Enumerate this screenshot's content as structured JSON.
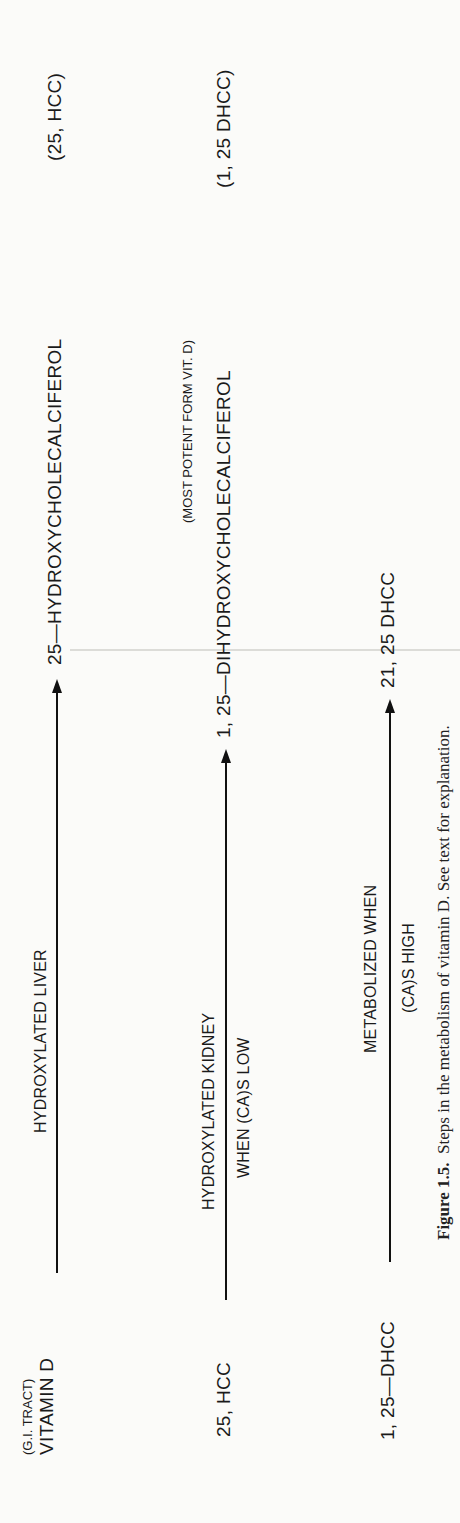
{
  "figure": {
    "rows": [
      {
        "source_note": "(G.I. TRACT)",
        "source": "VITAMIN  D",
        "process_top": "HYDROXYLATED   LIVER",
        "process_bottom": "",
        "product_note": "",
        "product": "25—HYDROXYCHOLECALCIFEROL",
        "product_abbrev": "(25, HCC)"
      },
      {
        "source_note": "",
        "source": "25, HCC",
        "process_top": "HYDROXYLATED KIDNEY",
        "process_bottom": "WHEN (CA)S LOW",
        "product_note": "(MOST POTENT FORM VIT. D)",
        "product": "1, 25—DIHYDROXYCHOLECALCIFEROL",
        "product_abbrev": "(1, 25 DHCC)"
      },
      {
        "source_note": "",
        "source": "1, 25—DHCC",
        "process_top": "METABOLIZED WHEN",
        "process_bottom": "(CA)S HIGH",
        "product_note": "",
        "product": "21, 25 DHCC",
        "product_abbrev": ""
      }
    ],
    "caption": {
      "label": "Figure 1.5.",
      "text": "Steps in the metabolism of vitamin D. See text for explanation."
    }
  }
}
